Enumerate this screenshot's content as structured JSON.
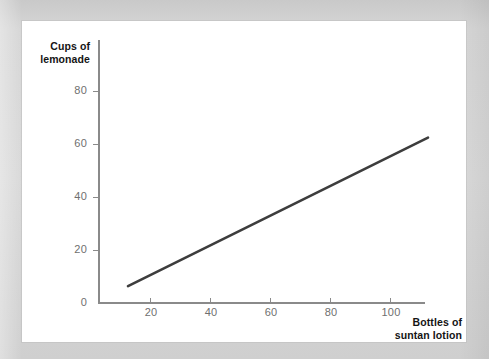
{
  "figure": {
    "background_color": "#ffffff",
    "mat_color": "#d3d3d3",
    "axis_color": "#8a8a8a",
    "tick_label_color": "#6f6f6f",
    "axis_title_color": "#141414"
  },
  "chart_data": {
    "type": "line",
    "title": "",
    "subtitle": "",
    "xlabel": "Bottles of suntan lotion",
    "ylabel": "Cups of lemonade",
    "ylabel_lines": [
      "Cups of",
      "lemonade"
    ],
    "xlabel_lines": [
      "Bottles of",
      "suntan lotion"
    ],
    "xlim": [
      0,
      122
    ],
    "ylim": [
      0,
      88
    ],
    "xticks": [
      20,
      40,
      60,
      80,
      100
    ],
    "xtick_labels": [
      "20",
      "40",
      "60",
      "80",
      "100"
    ],
    "yticks": [
      0,
      20,
      40,
      60,
      80
    ],
    "ytick_labels": [
      "0",
      "20",
      "40",
      "60",
      "80"
    ],
    "grid": false,
    "legend": null,
    "series": [
      {
        "name": "lemonade vs suntan lotion",
        "color": "#3d3d3d",
        "line_width": 2.6,
        "x": [
          10,
          110
        ],
        "y": [
          6,
          62
        ]
      }
    ],
    "annotations": []
  }
}
